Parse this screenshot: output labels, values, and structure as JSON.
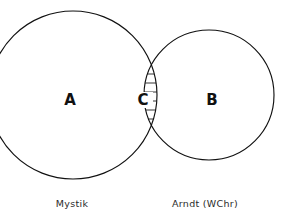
{
  "figure": {
    "type": "venn-diagram",
    "title_fragment_cut_off": "",
    "background_color": "#ffffff",
    "stroke_color": "#111111",
    "text_color": "#1a1a1a"
  },
  "sets": [
    {
      "id": "A",
      "label": "A",
      "caption": "Mystik",
      "side": "left",
      "cx": 73,
      "cy": 95,
      "r": 84,
      "label_x": 70,
      "label_y": 100,
      "caption_x": 72,
      "caption_y": 207
    },
    {
      "id": "B",
      "label": "B",
      "caption": "Arndt (WChr)",
      "side": "right",
      "cx": 209,
      "cy": 95,
      "r": 65,
      "label_x": 212,
      "label_y": 100,
      "caption_x": 205,
      "caption_y": 207
    }
  ],
  "intersection": {
    "id": "C",
    "label": "C",
    "fill_style": "horizontal-hatching",
    "label_x": 143,
    "label_y": 100,
    "hatch_spacing": 9,
    "hatch_top": 29,
    "hatch_bottom": 158,
    "hatch_color": "#111111"
  },
  "geometry": {
    "width": 283,
    "height": 218,
    "crossing_top_x": 139,
    "crossing_top_y": 27,
    "crossing_bottom_x": 139,
    "crossing_bottom_y": 160
  }
}
